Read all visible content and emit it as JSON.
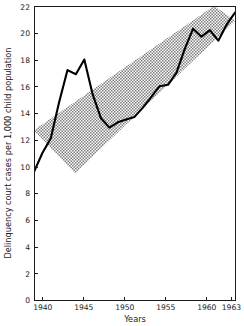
{
  "chart_data": {
    "type": "line",
    "title": "",
    "xlabel": "Years",
    "ylabel": "Delinquency court cases per 1,000 child population",
    "xlim": [
      1939,
      1963
    ],
    "ylim": [
      0,
      22
    ],
    "grid": false,
    "legend_position": "none",
    "xticks": [
      1940,
      1945,
      1950,
      1955,
      1960,
      1963
    ],
    "xtick_labels": [
      "1940",
      "1945",
      "1950",
      "1955",
      "1960",
      "1963"
    ],
    "yticks": [
      0,
      2,
      4,
      6,
      8,
      10,
      12,
      14,
      16,
      18,
      20,
      22
    ],
    "ytick_labels": [
      "0",
      "2",
      "4",
      "6",
      "8",
      "10",
      "12",
      "14",
      "16",
      "18",
      "20",
      "22"
    ],
    "series": [
      {
        "name": "Delinquency court cases rate",
        "style": "solid-black-line",
        "color": "#000000",
        "x": [
          1939,
          1940,
          1941,
          1942,
          1943,
          1944,
          1945,
          1946,
          1947,
          1948,
          1949,
          1950,
          1951,
          1952,
          1953,
          1954,
          1955,
          1956,
          1957,
          1958,
          1959,
          1960,
          1961,
          1962,
          1963
        ],
        "values": [
          9.6,
          11.0,
          12.1,
          14.8,
          17.2,
          16.9,
          18.0,
          15.4,
          13.6,
          12.9,
          13.3,
          13.5,
          13.7,
          14.4,
          15.2,
          16.0,
          16.1,
          17.0,
          18.8,
          20.3,
          19.7,
          20.2,
          19.4,
          20.6,
          21.5
        ]
      }
    ],
    "annotations": [
      {
        "name": "trend-band",
        "kind": "shaded-hatched-band",
        "description": "Cross-hatched diagonal band indicating expected trend range",
        "fill_color": "#9a9a9a",
        "upper_edge": [
          {
            "x": 1939,
            "y": 12.7
          },
          {
            "x": 1960.5,
            "y": 22.0
          }
        ],
        "lower_edge": [
          {
            "x": 1943.9,
            "y": 9.5
          },
          {
            "x": 1963,
            "y": 20.9
          }
        ]
      }
    ]
  },
  "axes": {
    "y_title": "Delinquency court cases per 1,000 child population",
    "x_title": "Years"
  }
}
